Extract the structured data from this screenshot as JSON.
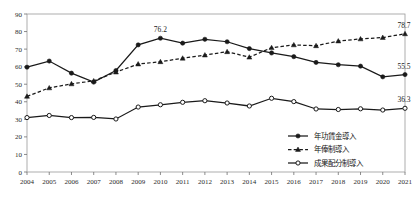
{
  "chart_data": {
    "type": "line",
    "title": "",
    "subtitle": "",
    "xlabel": "",
    "ylabel": "",
    "ylim": [
      0,
      90
    ],
    "ytick_step": 10,
    "yticks": [
      0,
      10,
      20,
      30,
      40,
      50,
      60,
      70,
      80,
      90
    ],
    "grid": false,
    "legend_position": "bottom-right",
    "categories": [
      "2004",
      "2005",
      "2006",
      "2007",
      "2008",
      "2009",
      "2010",
      "2011",
      "2012",
      "2013",
      "2014",
      "2015",
      "2016",
      "2017",
      "2018",
      "2019",
      "2020",
      "2021"
    ],
    "series": [
      {
        "name": "年功賃金導入",
        "marker": "filled-circle",
        "line_style": "solid",
        "color": "#1a1a1a",
        "values": [
          59.7,
          63.2,
          56.3,
          51.2,
          57.8,
          72.4,
          76.2,
          73.4,
          75.6,
          74.2,
          70.3,
          67.8,
          65.7,
          62.4,
          61.1,
          60.3,
          54.2,
          55.5
        ]
      },
      {
        "name": "年俸制導入",
        "marker": "filled-triangle",
        "line_style": "dashed",
        "color": "#1a1a1a",
        "values": [
          43.1,
          47.9,
          50.2,
          51.9,
          56.9,
          61.5,
          62.8,
          64.8,
          66.6,
          68.5,
          65.4,
          70.8,
          72.4,
          71.9,
          74.6,
          75.8,
          76.6,
          78.7
        ]
      },
      {
        "name": "成果配分制導入",
        "marker": "open-circle",
        "line_style": "solid",
        "color": "#1a1a1a",
        "values": [
          31.0,
          32.2,
          31.0,
          31.1,
          30.2,
          37.0,
          38.3,
          39.7,
          40.6,
          39.3,
          37.6,
          42.0,
          40.1,
          35.9,
          35.6,
          36.0,
          35.3,
          36.3
        ]
      }
    ],
    "annotations": [
      {
        "text": "76.2",
        "series": "年功賃金導入",
        "category": "2010"
      },
      {
        "text": "55.5",
        "series": "年功賃金導入",
        "category": "2021"
      },
      {
        "text": "78.7",
        "series": "年俸制導入",
        "category": "2021"
      },
      {
        "text": "36.3",
        "series": "成果配分制導入",
        "category": "2021"
      }
    ],
    "legend": [
      "年功賃金導入",
      "年俸制導入",
      "成果配分制導入"
    ]
  }
}
